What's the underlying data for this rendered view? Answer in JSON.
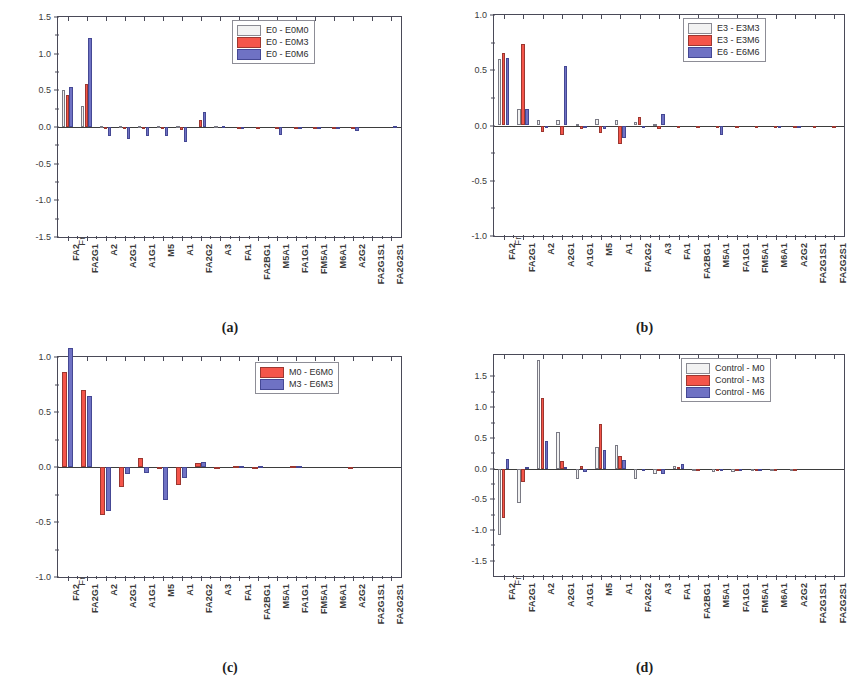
{
  "figure": {
    "ylabel": "Fractional difference in glycoforms",
    "categories": [
      "FA2",
      "FA2G1",
      "A2",
      "A2G1",
      "A1G1",
      "M5",
      "A1",
      "FA2G2",
      "A3",
      "FA1",
      "FA2BG1",
      "M5A1",
      "FA1G1",
      "FM5A1",
      "M6A1",
      "A2G2",
      "FA2G1S1",
      "FA2G2S1"
    ],
    "colors": {
      "white": "#f2f2f2",
      "red": "#f4554a",
      "blue": "#6f72c4",
      "axis": "#4a4a58"
    }
  },
  "panels": [
    {
      "id": "a",
      "caption": "(a)",
      "ylabel": "Fractional difference in glycoforms",
      "yticks": [
        "1.5",
        "1.0",
        "0.5",
        "0.0",
        "-0.5",
        "-1.0",
        "-1.5"
      ],
      "legend": [
        "E0 - E0M0",
        "E0 - E0M3",
        "E0 - E0M6"
      ]
    },
    {
      "id": "b",
      "caption": "(b)",
      "ylabel": "Fractional difference in glycoforms",
      "yticks": [
        "1.0",
        "0.5",
        "0.0",
        "-0.5",
        "-1.0"
      ],
      "legend": [
        "E3 - E3M3",
        "E3 - E3M6",
        "E6 - E6M6"
      ]
    },
    {
      "id": "c",
      "caption": "(c)",
      "ylabel": "Fractional difference in glycoforms",
      "yticks": [
        "1.0",
        "0.5",
        "0.0",
        "-0.5",
        "-1.0"
      ],
      "legend": [
        "M0 - E6M0",
        "M3 - E6M3"
      ]
    },
    {
      "id": "d",
      "caption": "(d)",
      "ylabel": "Fractional difference in glycoforms",
      "yticks": [
        "1.5",
        "1.0",
        "0.5",
        "0.0",
        "-0.5",
        "-1.0",
        "-1.5"
      ],
      "legend": [
        "Control - M0",
        "Control - M3",
        "Control - M6"
      ]
    }
  ],
  "chart_data": [
    {
      "panel": "a",
      "type": "bar",
      "title": "(a)",
      "xlabel": "",
      "ylabel": "Fractional difference in glycoforms",
      "ylim": [
        -1.5,
        1.5
      ],
      "ytick_step": 0.5,
      "grid": false,
      "legend_position": "top-right",
      "categories": [
        "FA2",
        "FA2G1",
        "A2",
        "A2G1",
        "A1G1",
        "M5",
        "A1",
        "FA2G2",
        "A3",
        "FA1",
        "FA2BG1",
        "M5A1",
        "FA1G1",
        "FM5A1",
        "M6A1",
        "A2G2",
        "FA2G1S1",
        "FA2G2S1"
      ],
      "series": [
        {
          "name": "E0 - E0M0",
          "color": "#f2f2f2",
          "values": [
            0.5,
            0.28,
            0.02,
            0.01,
            0.01,
            0.01,
            0.01,
            0.0,
            0.01,
            0.0,
            0.0,
            0.0,
            0.0,
            0.0,
            0.0,
            0.0,
            0.0,
            0.0
          ]
        },
        {
          "name": "E0 - E0M3",
          "color": "#f4554a",
          "values": [
            0.44,
            0.58,
            -0.01,
            -0.01,
            -0.01,
            -0.01,
            -0.04,
            0.1,
            0.0,
            -0.01,
            -0.01,
            -0.01,
            -0.01,
            -0.01,
            -0.01,
            -0.01,
            0.0,
            0.0
          ]
        },
        {
          "name": "E0 - E0M6",
          "color": "#6f72c4",
          "values": [
            0.54,
            1.21,
            -0.12,
            -0.16,
            -0.12,
            -0.12,
            -0.2,
            0.2,
            0.01,
            -0.01,
            0.0,
            -0.11,
            -0.01,
            -0.01,
            -0.01,
            -0.05,
            0.0,
            0.02
          ]
        }
      ]
    },
    {
      "panel": "b",
      "type": "bar",
      "title": "(b)",
      "xlabel": "",
      "ylabel": "Fractional difference in glycoforms",
      "ylim": [
        -1.0,
        1.0
      ],
      "ytick_step": 0.5,
      "grid": false,
      "legend_position": "top-right",
      "categories": [
        "FA2",
        "FA2G1",
        "A2",
        "A2G1",
        "A1G1",
        "M5",
        "A1",
        "FA2G2",
        "A3",
        "FA1",
        "FA2BG1",
        "M5A1",
        "FA1G1",
        "FM5A1",
        "M6A1",
        "A2G2",
        "FA2G1S1",
        "FA2G2S1"
      ],
      "series": [
        {
          "name": "E3 - E3M3",
          "color": "#f2f2f2",
          "values": [
            0.6,
            0.15,
            0.05,
            0.05,
            0.01,
            0.06,
            0.05,
            0.03,
            0.01,
            0.0,
            0.0,
            0.0,
            0.0,
            0.0,
            0.0,
            0.0,
            0.0,
            0.0
          ]
        },
        {
          "name": "E3 - E3M6",
          "color": "#f4554a",
          "values": [
            0.66,
            0.74,
            -0.06,
            -0.09,
            -0.03,
            -0.07,
            -0.17,
            0.08,
            -0.03,
            -0.01,
            -0.01,
            -0.01,
            -0.01,
            -0.01,
            -0.01,
            -0.01,
            -0.01,
            -0.01
          ]
        },
        {
          "name": "E6 - E6M6",
          "color": "#6f72c4",
          "values": [
            0.61,
            0.15,
            -0.02,
            0.54,
            -0.02,
            -0.03,
            -0.11,
            -0.01,
            0.1,
            0.0,
            0.0,
            -0.09,
            0.0,
            0.0,
            -0.01,
            -0.02,
            0.0,
            0.0
          ]
        }
      ]
    },
    {
      "panel": "c",
      "type": "bar",
      "title": "(c)",
      "xlabel": "",
      "ylabel": "Fractional difference in glycoforms",
      "ylim": [
        -1.0,
        1.0
      ],
      "ytick_step": 0.5,
      "grid": false,
      "legend_position": "top-right",
      "categories": [
        "FA2",
        "FA2G1",
        "A2",
        "A2G1",
        "A1G1",
        "M5",
        "A1",
        "FA2G2",
        "A3",
        "FA1",
        "FA2BG1",
        "M5A1",
        "FA1G1",
        "FM5A1",
        "M6A1",
        "A2G2",
        "FA2G1S1",
        "FA2G2S1"
      ],
      "series": [
        {
          "name": "M0 - E6M0",
          "color": "#f4554a",
          "values": [
            0.86,
            0.7,
            -0.44,
            -0.18,
            0.08,
            -0.01,
            -0.16,
            0.04,
            -0.01,
            0.01,
            -0.02,
            0.0,
            0.01,
            0.0,
            0.0,
            -0.01,
            0.0,
            0.0
          ]
        },
        {
          "name": "M3 - E6M3",
          "color": "#6f72c4",
          "values": [
            1.08,
            0.65,
            -0.4,
            -0.06,
            -0.05,
            -0.3,
            -0.1,
            0.05,
            0.0,
            0.01,
            0.01,
            0.0,
            0.01,
            0.0,
            0.0,
            0.0,
            0.0,
            0.0
          ]
        }
      ]
    },
    {
      "panel": "d",
      "type": "bar",
      "title": "(d)",
      "xlabel": "",
      "ylabel": "Fractional difference in glycoforms",
      "ylim": [
        -1.75,
        1.85
      ],
      "ytick_step": 0.5,
      "grid": false,
      "legend_position": "top-right",
      "categories": [
        "FA2",
        "FA2G1",
        "A2",
        "A2G1",
        "A1G1",
        "M5",
        "A1",
        "FA2G2",
        "A3",
        "FA1",
        "FA2BG1",
        "M5A1",
        "FA1G1",
        "FM5A1",
        "M6A1",
        "A2G2",
        "FA2G1S1",
        "FA2G2S1"
      ],
      "series": [
        {
          "name": "Control - M0",
          "color": "#f2f2f2",
          "values": [
            -1.08,
            -0.56,
            1.77,
            0.6,
            -0.17,
            0.35,
            0.38,
            -0.17,
            -0.09,
            0.05,
            -0.02,
            -0.05,
            -0.06,
            -0.04,
            -0.02,
            -0.01,
            0.0,
            0.0
          ]
        },
        {
          "name": "Control - M3",
          "color": "#f4554a",
          "values": [
            -0.8,
            -0.22,
            1.15,
            0.12,
            0.05,
            0.72,
            0.21,
            0.0,
            -0.01,
            0.02,
            -0.01,
            -0.03,
            -0.04,
            -0.03,
            -0.01,
            -0.01,
            0.0,
            0.0
          ]
        },
        {
          "name": "Control - M6",
          "color": "#6f72c4",
          "values": [
            0.15,
            0.02,
            0.45,
            0.02,
            -0.05,
            0.31,
            0.14,
            -0.02,
            -0.09,
            0.08,
            0.0,
            -0.01,
            -0.01,
            -0.01,
            0.0,
            0.0,
            0.0,
            0.0
          ]
        }
      ]
    }
  ]
}
